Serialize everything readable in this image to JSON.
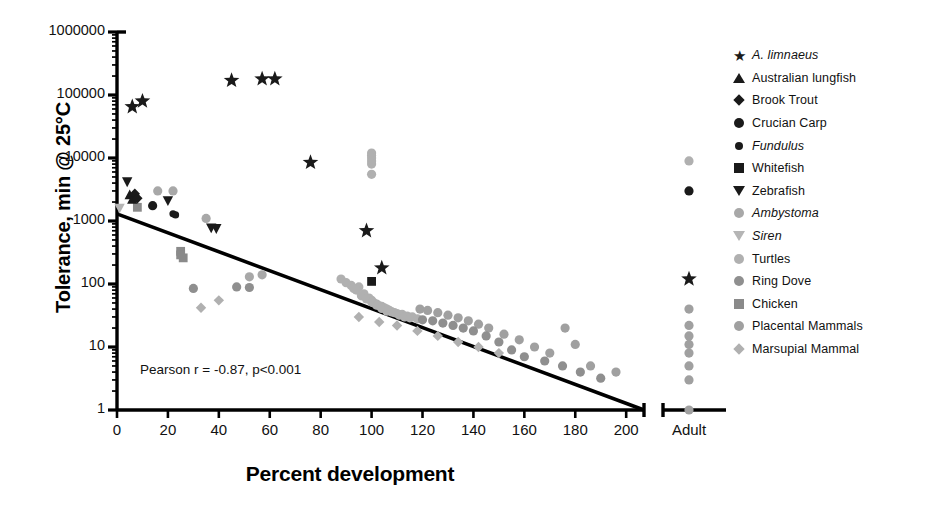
{
  "axes": {
    "y_title": "Tolerance, min @ 25°C",
    "x_title": "Percent development",
    "y_ticks": [
      "1000000",
      "100000",
      "10000",
      "1000",
      "100",
      "10",
      "1"
    ],
    "x_ticks": [
      "0",
      "20",
      "40",
      "60",
      "80",
      "100",
      "120",
      "140",
      "160",
      "180",
      "200"
    ],
    "adult_tick": "Adult"
  },
  "annotation": {
    "pearson": "Pearson r = -0.87, p<0.001"
  },
  "legend": {
    "items": [
      {
        "label": "A. limnaeus",
        "italic": true,
        "shape": "star",
        "color": "#1a1a1a"
      },
      {
        "label": "Australian lungfish",
        "italic": false,
        "shape": "triangle-up",
        "color": "#1a1a1a"
      },
      {
        "label": "Brook Trout",
        "italic": false,
        "shape": "diamond",
        "color": "#1a1a1a"
      },
      {
        "label": "Crucian Carp",
        "italic": false,
        "shape": "circle",
        "color": "#1a1a1a"
      },
      {
        "label": "Fundulus",
        "italic": true,
        "shape": "circle-sm",
        "color": "#1a1a1a"
      },
      {
        "label": "Whitefish",
        "italic": false,
        "shape": "square",
        "color": "#1a1a1a"
      },
      {
        "label": "Zebrafish",
        "italic": false,
        "shape": "triangle-dn",
        "color": "#1a1a1a"
      },
      {
        "label": "Ambystoma",
        "italic": true,
        "shape": "circle",
        "color": "#a8a8a8"
      },
      {
        "label": "Siren",
        "italic": true,
        "shape": "triangle-dn",
        "color": "#b5b5b5"
      },
      {
        "label": "Turtles",
        "italic": false,
        "shape": "circle",
        "color": "#b0b0b0"
      },
      {
        "label": "Ring Dove",
        "italic": false,
        "shape": "circle",
        "color": "#8f8f8f"
      },
      {
        "label": "Chicken",
        "italic": false,
        "shape": "square",
        "color": "#8a8a8a"
      },
      {
        "label": "Placental Mammals",
        "italic": false,
        "shape": "circle",
        "color": "#a0a0a0"
      },
      {
        "label": "Marsupial Mammal",
        "italic": false,
        "shape": "diamond",
        "color": "#b0b0b0"
      }
    ]
  },
  "chart_data": {
    "type": "scatter",
    "title": "",
    "xlabel": "Percent development",
    "ylabel": "Tolerance, min @ 25°C",
    "yscale": "log",
    "ylim": [
      1,
      1000000
    ],
    "xlim": [
      0,
      207
    ],
    "grid": false,
    "legend_position": "right",
    "axis_break": {
      "after_x": 207,
      "category": "Adult"
    },
    "annotations": [
      "Pearson r = -0.87, p<0.001"
    ],
    "trendline": {
      "x": [
        0,
        207
      ],
      "y": [
        1300,
        1
      ]
    },
    "series": [
      {
        "name": "A. limnaeus",
        "marker": "star",
        "color": "#1a1a1a",
        "points": [
          [
            6,
            65000
          ],
          [
            10,
            80000
          ],
          [
            45,
            170000
          ],
          [
            57,
            180000
          ],
          [
            62,
            180000
          ],
          [
            76,
            8500
          ],
          [
            98,
            700
          ],
          [
            104,
            180
          ]
        ],
        "adult_points": [
          120
        ]
      },
      {
        "name": "Australian lungfish",
        "marker": "triangle-up",
        "color": "#1a1a1a",
        "points": [
          [
            5,
            2600
          ],
          [
            6,
            2200
          ]
        ],
        "adult_points": []
      },
      {
        "name": "Brook Trout",
        "marker": "diamond",
        "color": "#1a1a1a",
        "points": [
          [
            7,
            2700
          ],
          [
            8,
            2300
          ]
        ],
        "adult_points": []
      },
      {
        "name": "Crucian Carp",
        "marker": "circle",
        "color": "#1a1a1a",
        "points": [
          [
            14,
            1750
          ]
        ],
        "adult_points": [
          3000
        ]
      },
      {
        "name": "Fundulus",
        "marker": "circle-sm",
        "color": "#1a1a1a",
        "points": [
          [
            22,
            1300
          ],
          [
            23,
            1250
          ]
        ],
        "adult_points": []
      },
      {
        "name": "Whitefish",
        "marker": "square",
        "color": "#1a1a1a",
        "points": [
          [
            100,
            110
          ]
        ],
        "adult_points": []
      },
      {
        "name": "Zebrafish",
        "marker": "triangle-dn",
        "color": "#1a1a1a",
        "points": [
          [
            4,
            4200
          ],
          [
            20,
            2100
          ],
          [
            37,
            780
          ],
          [
            39,
            760
          ]
        ],
        "adult_points": []
      },
      {
        "name": "Ambystoma",
        "marker": "circle",
        "color": "#a8a8a8",
        "points": [
          [
            16,
            3000
          ],
          [
            22,
            3000
          ],
          [
            35,
            1100
          ],
          [
            52,
            130
          ],
          [
            57,
            140
          ]
        ],
        "adult_points": []
      },
      {
        "name": "Siren",
        "marker": "triangle-dn",
        "color": "#b5b5b5",
        "points": [
          [
            1,
            1600
          ]
        ],
        "adult_points": []
      },
      {
        "name": "Turtles",
        "marker": "circle",
        "color": "#b0b0b0",
        "points": [
          [
            100,
            12000
          ],
          [
            100,
            11000
          ],
          [
            100,
            10000
          ],
          [
            100,
            9000
          ],
          [
            100,
            8000
          ],
          [
            100,
            5500
          ],
          [
            95,
            90
          ],
          [
            97,
            70
          ],
          [
            99,
            60
          ],
          [
            100,
            55
          ],
          [
            101,
            50
          ],
          [
            102,
            48
          ],
          [
            103,
            45
          ],
          [
            104,
            44
          ],
          [
            105,
            42
          ],
          [
            106,
            40
          ],
          [
            107,
            38
          ],
          [
            108,
            36
          ],
          [
            110,
            34
          ],
          [
            112,
            33
          ],
          [
            114,
            31
          ],
          [
            116,
            30
          ],
          [
            92,
            95
          ],
          [
            94,
            80
          ],
          [
            96,
            65
          ],
          [
            98,
            58
          ],
          [
            100,
            52
          ],
          [
            102,
            46
          ],
          [
            104,
            41
          ],
          [
            106,
            37
          ],
          [
            88,
            120
          ],
          [
            90,
            105
          ],
          [
            93,
            85
          ],
          [
            109,
            35
          ],
          [
            111,
            32
          ],
          [
            113,
            30
          ],
          [
            115,
            29
          ],
          [
            118,
            28
          ]
        ],
        "adult_points": [
          9000
        ]
      },
      {
        "name": "Ring Dove",
        "marker": "circle",
        "color": "#8f8f8f",
        "points": [
          [
            30,
            85
          ],
          [
            47,
            90
          ],
          [
            52,
            88
          ],
          [
            120,
            27
          ],
          [
            124,
            26
          ],
          [
            128,
            24
          ],
          [
            132,
            22
          ],
          [
            136,
            20
          ],
          [
            140,
            18
          ],
          [
            145,
            15
          ],
          [
            150,
            12
          ],
          [
            155,
            9
          ],
          [
            160,
            7
          ],
          [
            168,
            6
          ],
          [
            175,
            5
          ],
          [
            182,
            4
          ],
          [
            190,
            3.2
          ]
        ],
        "adult_points": []
      },
      {
        "name": "Chicken",
        "marker": "square",
        "color": "#8a8a8a",
        "points": [
          [
            8,
            1650
          ],
          [
            25,
            330
          ],
          [
            25,
            290
          ],
          [
            26,
            260
          ]
        ],
        "adult_points": []
      },
      {
        "name": "Placental Mammals",
        "marker": "circle",
        "color": "#a0a0a0",
        "points": [
          [
            119,
            40
          ],
          [
            122,
            38
          ],
          [
            126,
            35
          ],
          [
            130,
            32
          ],
          [
            134,
            29
          ],
          [
            138,
            26
          ],
          [
            142,
            23
          ],
          [
            146,
            20
          ],
          [
            152,
            16
          ],
          [
            158,
            13
          ],
          [
            164,
            10
          ],
          [
            170,
            8
          ],
          [
            176,
            20
          ],
          [
            180,
            11
          ],
          [
            186,
            5
          ],
          [
            196,
            4
          ]
        ],
        "adult_points": [
          40,
          22,
          15,
          11,
          8,
          5,
          3,
          1
        ]
      },
      {
        "name": "Marsupial Mammal",
        "marker": "diamond",
        "color": "#b0b0b0",
        "points": [
          [
            33,
            42
          ],
          [
            40,
            55
          ],
          [
            95,
            30
          ],
          [
            103,
            25
          ],
          [
            110,
            22
          ],
          [
            118,
            18
          ],
          [
            126,
            15
          ],
          [
            134,
            12
          ],
          [
            142,
            10
          ],
          [
            150,
            8
          ]
        ],
        "adult_points": []
      }
    ]
  }
}
